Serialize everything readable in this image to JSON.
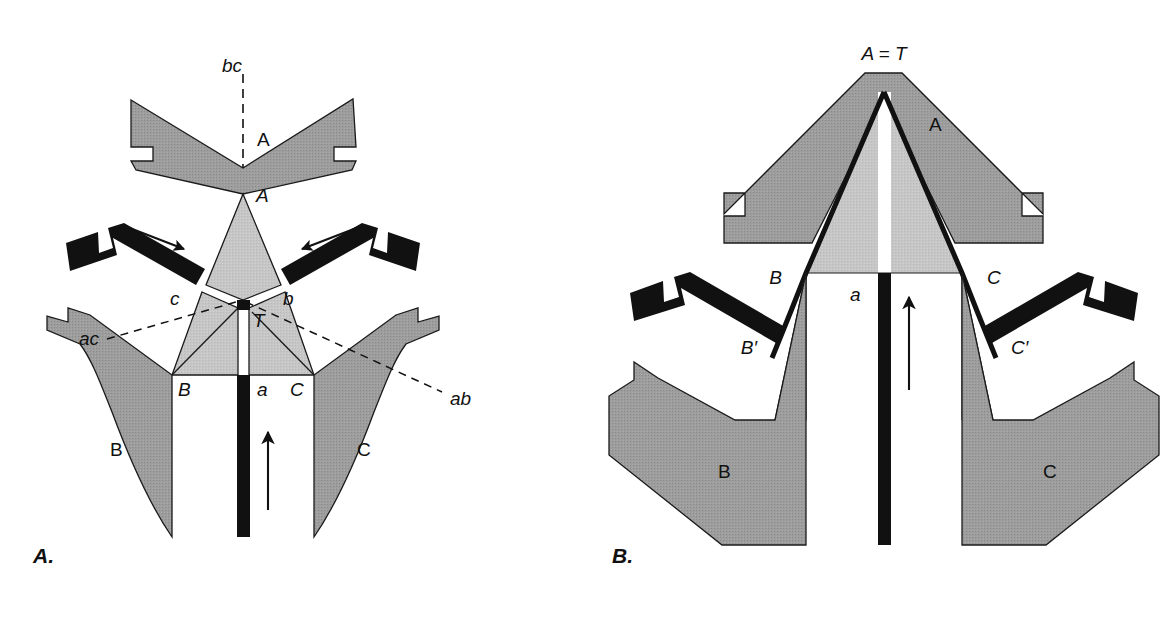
{
  "figure": {
    "panels": [
      {
        "id": "A",
        "label": "A.",
        "state": "separated",
        "blocks": [
          {
            "name": "A",
            "label": "A",
            "shade": "dark-gray"
          },
          {
            "name": "B",
            "label": "B",
            "shade": "dark-gray"
          },
          {
            "name": "C",
            "label": "C",
            "shade": "dark-gray"
          }
        ],
        "junction_labels": [
          {
            "name": "apex-A",
            "text": "A"
          },
          {
            "name": "point-B",
            "text": "B"
          },
          {
            "name": "point-C",
            "text": "C"
          },
          {
            "name": "point-T",
            "text": "T"
          },
          {
            "name": "arm-b",
            "text": "b"
          },
          {
            "name": "arm-c",
            "text": "c"
          },
          {
            "name": "arm-a",
            "text": "a"
          }
        ],
        "boundary_labels": [
          {
            "name": "boundary-bc",
            "text": "bc"
          },
          {
            "name": "boundary-ac",
            "text": "ac"
          },
          {
            "name": "boundary-ab",
            "text": "ab"
          }
        ]
      },
      {
        "id": "B",
        "label": "B.",
        "state": "converged",
        "apex_label": "A = T",
        "blocks": [
          {
            "name": "A",
            "label": "A",
            "shade": "dark-gray"
          },
          {
            "name": "B",
            "label": "B",
            "shade": "dark-gray"
          },
          {
            "name": "C",
            "label": "C",
            "shade": "dark-gray"
          }
        ],
        "junction_labels": [
          {
            "name": "point-B",
            "text": "B"
          },
          {
            "name": "point-C",
            "text": "C"
          },
          {
            "name": "point-B-prime",
            "text": "B′"
          },
          {
            "name": "point-C-prime",
            "text": "C′"
          },
          {
            "name": "arm-a",
            "text": "a"
          }
        ]
      }
    ],
    "colors": {
      "dark_gray": "#9d9d9d",
      "light_gray": "#c6c6c6",
      "black": "#111111",
      "white": "#ffffff",
      "outline": "#1a1a1a"
    }
  }
}
